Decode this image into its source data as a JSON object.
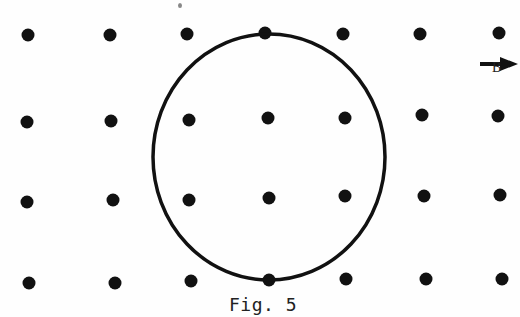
{
  "figure": {
    "caption": "Fig. 5",
    "field_label": "B",
    "dot_color": "#111111",
    "loop_color": "#111111",
    "dots": [
      [
        28,
        35
      ],
      [
        110,
        35
      ],
      [
        187,
        34
      ],
      [
        265,
        33
      ],
      [
        343,
        34
      ],
      [
        420,
        34
      ],
      [
        499,
        33
      ],
      [
        27,
        122
      ],
      [
        111,
        121
      ],
      [
        189,
        120
      ],
      [
        268,
        118
      ],
      [
        345,
        118
      ],
      [
        422,
        115
      ],
      [
        498,
        116
      ],
      [
        27,
        202
      ],
      [
        113,
        200
      ],
      [
        189,
        200
      ],
      [
        269,
        198
      ],
      [
        345,
        196
      ],
      [
        424,
        196
      ],
      [
        500,
        195
      ],
      [
        29,
        283
      ],
      [
        115,
        283
      ],
      [
        191,
        281
      ],
      [
        269,
        280
      ],
      [
        346,
        279
      ],
      [
        426,
        279
      ],
      [
        502,
        279
      ]
    ],
    "loop": {
      "cx": 269,
      "cy": 157,
      "rx": 116,
      "ry": 123
    },
    "arrow": {
      "x1": 480,
      "y1": 64,
      "x2": 518,
      "y2": 64
    }
  }
}
